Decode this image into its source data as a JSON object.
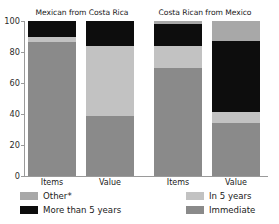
{
  "chart_data": {
    "type": "bar",
    "subtype": "stacked-percentage",
    "title": "",
    "panels": [
      {
        "title": "Mexican from Costa Rica",
        "categories": [
          "Items",
          "Value"
        ],
        "series": [
          {
            "name": "Immediate",
            "values": [
              86.5,
              39
            ]
          },
          {
            "name": "In 5 years",
            "values": [
              3.5,
              45
            ]
          },
          {
            "name": "More than 5 years",
            "values": [
              10,
              16
            ]
          },
          {
            "name": "Other*",
            "values": [
              0,
              0
            ]
          }
        ]
      },
      {
        "title": "Costa Rican from Mexico",
        "categories": [
          "Items",
          "Value"
        ],
        "series": [
          {
            "name": "Immediate",
            "values": [
              70,
              34
            ]
          },
          {
            "name": "In 5 years",
            "values": [
              14,
              7
            ]
          },
          {
            "name": "More than 5 years",
            "values": [
              14,
              46
            ]
          },
          {
            "name": "Other*",
            "values": [
              2,
              13
            ]
          }
        ]
      }
    ],
    "xlabel": "",
    "ylabel": "",
    "ylim": [
      0,
      100
    ],
    "yticks": [
      0,
      20,
      40,
      60,
      80,
      100
    ],
    "ytick_labels": [
      "0",
      "20",
      "40",
      "60",
      "80",
      "100"
    ],
    "grid": false,
    "legend_position": "bottom",
    "legend": [
      {
        "label": "Other*",
        "color": "#a8a8a8"
      },
      {
        "label": "More than 5 years",
        "color": "#0d0d0d"
      },
      {
        "label": "In 5 years",
        "color": "#c2c2c2"
      },
      {
        "label": "Immediate",
        "color": "#8a8a8a"
      }
    ]
  },
  "colors": {
    "other": "#a8a8a8",
    "more_than_5_years": "#0d0d0d",
    "in_5_years": "#c2c2c2",
    "immediate": "#8a8a8a",
    "axis": "#9a9a9a",
    "text": "#1a1a1a",
    "background": "#ffffff"
  }
}
